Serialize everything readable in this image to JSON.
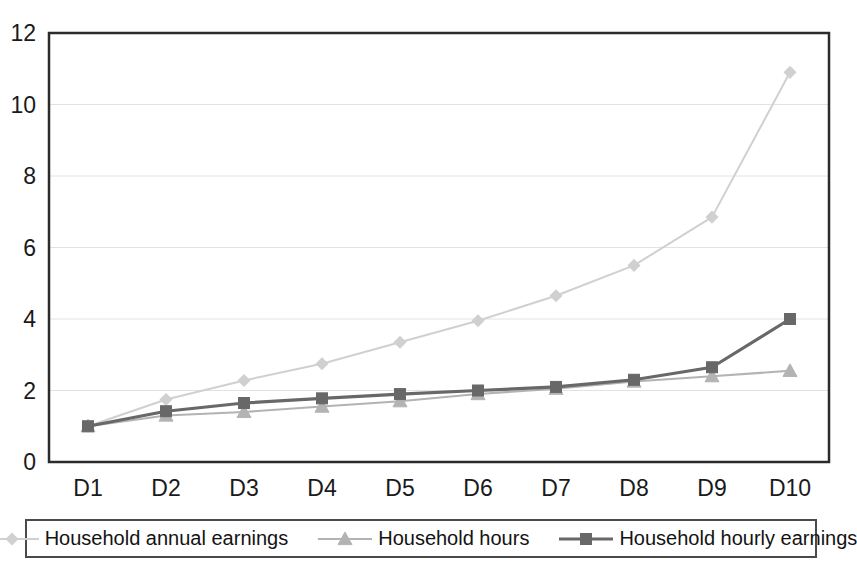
{
  "chart_data": {
    "type": "line",
    "title": "",
    "xlabel": "",
    "ylabel": "",
    "categories": [
      "D1",
      "D2",
      "D3",
      "D4",
      "D5",
      "D6",
      "D7",
      "D8",
      "D9",
      "D10"
    ],
    "ylim": [
      0,
      12
    ],
    "ytick_labels": [
      "0",
      "2",
      "4",
      "6",
      "8",
      "10",
      "12"
    ],
    "ytick_values": [
      0,
      2,
      4,
      6,
      8,
      10,
      12
    ],
    "grid": true,
    "grid_axis": "y",
    "legend_position": "bottom",
    "series": [
      {
        "name": "Household annual earnings",
        "color": "#d0d0d0",
        "marker": "diamond",
        "values": [
          1.0,
          1.75,
          2.28,
          2.75,
          3.35,
          3.95,
          4.65,
          5.5,
          6.85,
          10.9
        ]
      },
      {
        "name": "Household hours",
        "color": "#b3b3b3",
        "marker": "triangle",
        "values": [
          1.0,
          1.3,
          1.4,
          1.55,
          1.7,
          1.9,
          2.05,
          2.25,
          2.4,
          2.55
        ]
      },
      {
        "name": "Household hourly earnings",
        "color": "#686868",
        "marker": "square",
        "values": [
          1.0,
          1.42,
          1.65,
          1.78,
          1.9,
          2.0,
          2.1,
          2.3,
          2.65,
          4.0
        ]
      }
    ]
  },
  "legend": {
    "entries": [
      {
        "label": "Household annual earnings",
        "marker": "diamond-marker",
        "color": "#d0d0d0"
      },
      {
        "label": "Household hours",
        "marker": "triangle-marker",
        "color": "#b3b3b3"
      },
      {
        "label": "Household hourly earnings",
        "marker": "square-marker",
        "color": "#686868"
      }
    ]
  },
  "axes": {
    "frame_color": "#2b2b2b",
    "grid_color": "#e2e2e2",
    "tick_text_color": "#1a1a1a"
  }
}
